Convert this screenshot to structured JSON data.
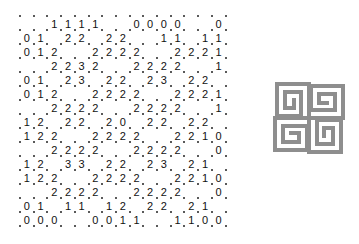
{
  "puzzle": {
    "type": "slitherlink",
    "rows": 15,
    "cols": 15,
    "grid": [
      [
        ".",
        ".",
        "1",
        "1",
        "1",
        "1",
        ".",
        ".",
        "0",
        "0",
        "0",
        "0",
        ".",
        ".",
        "0"
      ],
      [
        "0",
        "1",
        ".",
        "2",
        "2",
        ".",
        "2",
        "2",
        ".",
        ".",
        "1",
        "1",
        ".",
        "1",
        "1"
      ],
      [
        "0",
        "1",
        "2",
        ".",
        ".",
        "2",
        "2",
        "2",
        "2",
        ".",
        ".",
        "2",
        "2",
        "2",
        "1"
      ],
      [
        ".",
        ".",
        "2",
        "2",
        "3",
        "2",
        ".",
        ".",
        "2",
        "2",
        "2",
        "2",
        ".",
        ".",
        "1"
      ],
      [
        "0",
        "1",
        ".",
        "2",
        "3",
        ".",
        "2",
        "2",
        ".",
        "2",
        "3",
        ".",
        "2",
        "2",
        "."
      ],
      [
        "0",
        "1",
        "2",
        ".",
        ".",
        "2",
        "2",
        "2",
        "2",
        ".",
        ".",
        "2",
        "2",
        "2",
        "1"
      ],
      [
        ".",
        ".",
        "2",
        "2",
        "2",
        "2",
        ".",
        ".",
        "2",
        "2",
        "2",
        "2",
        ".",
        ".",
        "1"
      ],
      [
        "1",
        "2",
        ".",
        "2",
        "2",
        ".",
        "2",
        "0",
        ".",
        "2",
        "2",
        ".",
        "2",
        "2",
        "."
      ],
      [
        "1",
        "2",
        "2",
        ".",
        ".",
        "2",
        "2",
        "2",
        "2",
        ".",
        ".",
        "2",
        "2",
        "1",
        "0"
      ],
      [
        ".",
        ".",
        "2",
        "2",
        "2",
        "2",
        ".",
        ".",
        "2",
        "2",
        "2",
        "2",
        ".",
        ".",
        "0"
      ],
      [
        "1",
        "2",
        ".",
        "3",
        "3",
        ".",
        "2",
        "2",
        ".",
        "2",
        "3",
        ".",
        "2",
        "1",
        "."
      ],
      [
        "1",
        "2",
        "2",
        ".",
        ".",
        "2",
        "2",
        "2",
        "2",
        ".",
        ".",
        "2",
        "2",
        "1",
        "0"
      ],
      [
        ".",
        ".",
        "2",
        "2",
        "2",
        "2",
        ".",
        ".",
        "2",
        "2",
        "2",
        "2",
        ".",
        ".",
        "0"
      ],
      [
        "0",
        "1",
        ".",
        "1",
        "1",
        ".",
        "1",
        "2",
        ".",
        "2",
        "2",
        ".",
        "2",
        "1",
        "."
      ],
      [
        "0",
        "0",
        "0",
        ".",
        ".",
        "0",
        "0",
        "1",
        "1",
        ".",
        ".",
        "1",
        "1",
        "0",
        "0"
      ]
    ]
  },
  "logo": {
    "icon": "greek-key-pinwheel-icon",
    "color": "#8e8e8e"
  }
}
